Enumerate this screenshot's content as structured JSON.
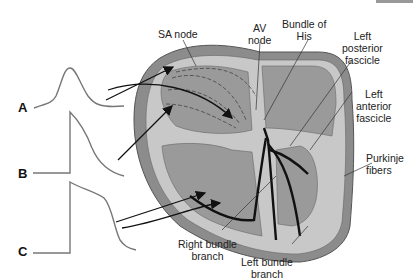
{
  "waveforms": [
    {
      "id": "A",
      "label": "A"
    },
    {
      "id": "B",
      "label": "B"
    },
    {
      "id": "C",
      "label": "C"
    }
  ],
  "labels": {
    "sa_node": "SA node",
    "av_node_1": "AV",
    "av_node_2": "node",
    "bundle_his_1": "Bundle of",
    "bundle_his_2": "His",
    "left_post_1": "Left",
    "left_post_2": "posterior",
    "left_post_3": "fascicle",
    "left_ant_1": "Left",
    "left_ant_2": "anterior",
    "left_ant_3": "fascicle",
    "purkinje_1": "Purkinje",
    "purkinje_2": "fibers",
    "right_bundle_1": "Right bundle",
    "right_bundle_2": "branch",
    "left_bundle_1": "Left bundle",
    "left_bundle_2": "branch"
  },
  "colors": {
    "outer_tissue": "#8c8c8c",
    "light_tissue": "#c8c8c8",
    "chamber": "#9a9a9a",
    "conduction": "#111111"
  }
}
